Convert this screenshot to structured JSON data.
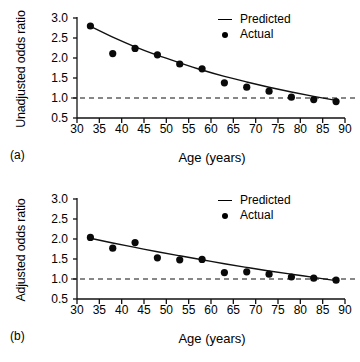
{
  "figure": {
    "xlabel": "Age (years)",
    "legend": {
      "predicted": "Predicted",
      "actual": "Actual"
    },
    "panel_a_tag": "(a)",
    "panel_b_tag": "(b)"
  },
  "chart_data": [
    {
      "type": "scatter",
      "panel": "(a)",
      "title": "",
      "xlabel": "Age (years)",
      "ylabel": "Unadjusted odds ratio",
      "xlim": [
        30,
        90
      ],
      "ylim": [
        0.5,
        3.0
      ],
      "xticks": [
        30,
        35,
        40,
        45,
        50,
        55,
        60,
        65,
        70,
        75,
        80,
        85,
        90
      ],
      "yticks": [
        0.5,
        1.0,
        1.5,
        2.0,
        2.5,
        3.0
      ],
      "xtick_labels": [
        "30",
        "35",
        "40",
        "45",
        "50",
        "55",
        "60",
        "65",
        "70",
        "75",
        "80",
        "85",
        "90"
      ],
      "ytick_labels": [
        "0.5",
        "1.0",
        "1.5",
        "2.0",
        "2.5",
        "3.0"
      ],
      "grid": false,
      "legend_position": "top-right",
      "reference_line": {
        "y": 1.0,
        "style": "dashed"
      },
      "series": [
        {
          "name": "Actual",
          "style": "points",
          "x": [
            33,
            38,
            43,
            48,
            53,
            58,
            63,
            68,
            73,
            78,
            83,
            88
          ],
          "values": [
            2.8,
            2.11,
            2.24,
            2.08,
            1.85,
            1.73,
            1.38,
            1.27,
            1.17,
            1.02,
            0.96,
            0.91
          ]
        },
        {
          "name": "Predicted",
          "style": "line",
          "x": [
            33,
            38,
            43,
            48,
            53,
            58,
            63,
            68,
            73,
            78,
            83,
            88
          ],
          "values": [
            2.79,
            2.52,
            2.28,
            2.07,
            1.88,
            1.7,
            1.54,
            1.4,
            1.27,
            1.15,
            1.04,
            0.94
          ]
        }
      ]
    },
    {
      "type": "scatter",
      "panel": "(b)",
      "title": "",
      "xlabel": "Age (years)",
      "ylabel": "Adjusted odds ratio",
      "xlim": [
        30,
        90
      ],
      "ylim": [
        0.5,
        3.0
      ],
      "xticks": [
        30,
        35,
        40,
        45,
        50,
        55,
        60,
        65,
        70,
        75,
        80,
        85,
        90
      ],
      "yticks": [
        0.5,
        1.0,
        1.5,
        2.0,
        2.5,
        3.0
      ],
      "xtick_labels": [
        "30",
        "35",
        "40",
        "45",
        "50",
        "55",
        "60",
        "65",
        "70",
        "75",
        "80",
        "85",
        "90"
      ],
      "ytick_labels": [
        "0.5",
        "1.0",
        "1.5",
        "2.0",
        "2.5",
        "3.0"
      ],
      "grid": false,
      "legend_position": "top-right",
      "reference_line": {
        "y": 1.0,
        "style": "dashed"
      },
      "series": [
        {
          "name": "Actual",
          "style": "points",
          "x": [
            33,
            38,
            43,
            48,
            53,
            58,
            63,
            68,
            73,
            78,
            83,
            88
          ],
          "values": [
            2.04,
            1.77,
            1.91,
            1.53,
            1.48,
            1.49,
            1.16,
            1.18,
            1.12,
            1.05,
            1.02,
            0.97
          ]
        },
        {
          "name": "Predicted",
          "style": "line",
          "x": [
            33,
            38,
            43,
            48,
            53,
            58,
            63,
            68,
            73,
            78,
            83,
            88
          ],
          "values": [
            2.02,
            1.9,
            1.79,
            1.68,
            1.58,
            1.48,
            1.38,
            1.29,
            1.2,
            1.12,
            1.04,
            0.96
          ]
        }
      ]
    }
  ]
}
